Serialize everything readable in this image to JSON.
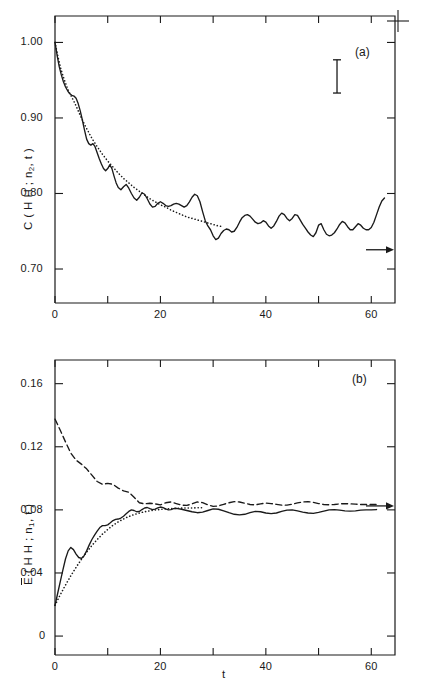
{
  "figure": {
    "width": 421,
    "height": 693,
    "background": "#ffffff",
    "ink": "#1a1a1a",
    "registration_mark": "+"
  },
  "chart_data": [
    {
      "type": "line",
      "panel_tag": "(a)",
      "title": "",
      "xlabel": "",
      "ylabel": "C (HH; n2,t)",
      "ylabel_parts": {
        "pre": "C ( H H ; n",
        "sub": "2",
        "post": ", t )"
      },
      "xlim": [
        0,
        64.5
      ],
      "ylim": [
        0.655,
        1.035
      ],
      "grid": false,
      "legend_position": "none",
      "xticks": [
        0,
        10,
        20,
        30,
        40,
        50,
        60
      ],
      "xticklabels": [
        "0",
        "",
        "20",
        "",
        "40",
        "",
        "60"
      ],
      "yticks": [
        1.0,
        0.9,
        0.8,
        0.7
      ],
      "yticklabels": [
        "1.00",
        "0.90",
        "0.80",
        "0.70"
      ],
      "error_bar": {
        "center": 0.955,
        "half_height": 0.022,
        "x": 53.5
      },
      "arrow_annotation": {
        "y": 0.7255,
        "label": "",
        "points": "right-to-axis"
      },
      "series": [
        {
          "name": "simulation",
          "style": "solid",
          "x": [
            0,
            0.4,
            0.8,
            1.2,
            1.6,
            2.0,
            2.4,
            2.8,
            3.2,
            3.6,
            4.0,
            4.4,
            4.8,
            5.2,
            5.6,
            6.0,
            6.4,
            6.8,
            7.2,
            7.6,
            8.0,
            8.4,
            8.8,
            9.2,
            9.6,
            10.0,
            10.4,
            10.8,
            11.2,
            11.6,
            12.0,
            12.5,
            13.0,
            13.5,
            14.0,
            14.5,
            15.0,
            15.5,
            16.0,
            16.5,
            17.0,
            17.5,
            18.0,
            18.5,
            19.0,
            19.5,
            20.0,
            20.5,
            21.0,
            21.5,
            22.0,
            22.5,
            23.0,
            23.5,
            24.0,
            24.5,
            25.0,
            25.5,
            26.0,
            26.5,
            27.0,
            27.5,
            28.0,
            28.5,
            29.0,
            29.5,
            30.0,
            30.5,
            31.0,
            31.5,
            32.0,
            32.5,
            33.0,
            33.5,
            34.0,
            34.5,
            35.0,
            35.5,
            36.0,
            36.5,
            37.0,
            37.5,
            38.0,
            38.5,
            39.0,
            39.5,
            40.0,
            40.5,
            41.0,
            41.5,
            42.0,
            42.5,
            43.0,
            43.5,
            44.0,
            44.5,
            45.0,
            45.5,
            46.0,
            46.5,
            47.0,
            47.5,
            48.0,
            48.5,
            49.0,
            49.5,
            50.0,
            50.5,
            51.0,
            51.5,
            52.0,
            52.5,
            53.0,
            53.5,
            54.0,
            54.5,
            55.0,
            55.5,
            56.0,
            56.5,
            57.0,
            57.5,
            58.0,
            58.5,
            59.0,
            59.5,
            60.0,
            60.5,
            61.0,
            61.5,
            62.0,
            62.5,
            63.0
          ],
          "y": [
            1.0,
            0.983,
            0.968,
            0.957,
            0.948,
            0.941,
            0.936,
            0.932,
            0.93,
            0.929,
            0.926,
            0.919,
            0.909,
            0.897,
            0.884,
            0.872,
            0.866,
            0.864,
            0.866,
            0.862,
            0.854,
            0.846,
            0.839,
            0.833,
            0.83,
            0.833,
            0.838,
            0.833,
            0.823,
            0.814,
            0.808,
            0.805,
            0.809,
            0.812,
            0.807,
            0.8,
            0.794,
            0.791,
            0.795,
            0.801,
            0.799,
            0.793,
            0.786,
            0.782,
            0.783,
            0.787,
            0.789,
            0.787,
            0.784,
            0.783,
            0.784,
            0.786,
            0.787,
            0.786,
            0.784,
            0.782,
            0.784,
            0.789,
            0.795,
            0.799,
            0.797,
            0.789,
            0.776,
            0.764,
            0.757,
            0.752,
            0.744,
            0.739,
            0.741,
            0.747,
            0.751,
            0.753,
            0.752,
            0.749,
            0.75,
            0.755,
            0.762,
            0.768,
            0.771,
            0.772,
            0.77,
            0.766,
            0.762,
            0.76,
            0.761,
            0.764,
            0.762,
            0.757,
            0.754,
            0.757,
            0.763,
            0.77,
            0.774,
            0.772,
            0.767,
            0.764,
            0.767,
            0.772,
            0.771,
            0.765,
            0.759,
            0.754,
            0.749,
            0.745,
            0.743,
            0.748,
            0.758,
            0.76,
            0.752,
            0.746,
            0.744,
            0.745,
            0.748,
            0.753,
            0.759,
            0.763,
            0.761,
            0.756,
            0.752,
            0.752,
            0.756,
            0.76,
            0.758,
            0.754,
            0.752,
            0.752,
            0.755,
            0.762,
            0.772,
            0.782,
            0.79,
            0.794
          ]
        },
        {
          "name": "theory",
          "style": "dotted",
          "x": [
            0,
            0.5,
            1.0,
            1.5,
            2.0,
            2.5,
            3.0,
            3.5,
            4.0,
            5.0,
            6.0,
            7.0,
            8.0,
            9.0,
            10.0,
            11.0,
            12.0,
            13.0,
            14.0,
            15.0,
            16.0,
            17.0,
            18.0,
            19.0,
            20.0,
            21.0,
            22.0,
            23.0,
            24.0,
            25.0,
            26.0,
            27.0,
            28.0,
            29.0,
            30.0,
            31.0,
            32.0
          ],
          "y": [
            1.0,
            0.983,
            0.968,
            0.956,
            0.946,
            0.937,
            0.93,
            0.923,
            0.916,
            0.9,
            0.886,
            0.873,
            0.862,
            0.852,
            0.843,
            0.835,
            0.827,
            0.82,
            0.814,
            0.808,
            0.803,
            0.798,
            0.793,
            0.789,
            0.785,
            0.782,
            0.778,
            0.775,
            0.772,
            0.769,
            0.767,
            0.765,
            0.763,
            0.761,
            0.759,
            0.757,
            0.756
          ]
        }
      ]
    },
    {
      "type": "line",
      "panel_tag": "(b)",
      "title": "",
      "xlabel": "t",
      "ylabel": "E (HH; n1,t)",
      "ylabel_parts": {
        "pre": "E",
        "mid": " ( H H ; n",
        "sub": "1",
        "post": ", t )"
      },
      "xlim": [
        0,
        64.5
      ],
      "ylim": [
        -0.012,
        0.175
      ],
      "grid": false,
      "legend_position": "none",
      "xticks": [
        0,
        10,
        20,
        30,
        40,
        50,
        60
      ],
      "xticklabels": [
        "0",
        "",
        "20",
        "",
        "40",
        "",
        "60"
      ],
      "yticks": [
        0.16,
        0.12,
        0.08,
        0.04,
        0
      ],
      "yticklabels": [
        "0.16",
        "0.12",
        "0.08",
        "0.04",
        "0"
      ],
      "arrow_annotation": {
        "y": 0.0825,
        "label": "",
        "points": "right-to-axis"
      },
      "series": [
        {
          "name": "upper-branch",
          "style": "dashed",
          "x": [
            0,
            1,
            2,
            3,
            4,
            5,
            6,
            7,
            8,
            9,
            10,
            11,
            12,
            13,
            14,
            15,
            16,
            17,
            18,
            19,
            20,
            21,
            22,
            23,
            24,
            25,
            26,
            27,
            28,
            29,
            30,
            31,
            32,
            33,
            34,
            35,
            36,
            37,
            38,
            39,
            40,
            41,
            42,
            43,
            44,
            45,
            46,
            47,
            48,
            49,
            50,
            51,
            52,
            53,
            54,
            55,
            56,
            57,
            58,
            59,
            60,
            61
          ],
          "y": [
            0.1375,
            0.1305,
            0.123,
            0.116,
            0.1115,
            0.109,
            0.106,
            0.102,
            0.098,
            0.0962,
            0.0968,
            0.0962,
            0.0938,
            0.092,
            0.0912,
            0.088,
            0.0845,
            0.0838,
            0.0842,
            0.0838,
            0.0832,
            0.0845,
            0.085,
            0.084,
            0.083,
            0.0828,
            0.0838,
            0.085,
            0.0846,
            0.0832,
            0.0822,
            0.0825,
            0.0835,
            0.0845,
            0.0852,
            0.085,
            0.0842,
            0.0834,
            0.0832,
            0.0838,
            0.0843,
            0.084,
            0.0835,
            0.083,
            0.083,
            0.0836,
            0.0844,
            0.085,
            0.0852,
            0.0848,
            0.084,
            0.0834,
            0.0832,
            0.0834,
            0.0838,
            0.084,
            0.0838,
            0.0836,
            0.0834,
            0.0834,
            0.0834,
            0.0834
          ]
        },
        {
          "name": "lower-branch",
          "style": "solid",
          "x": [
            0,
            0.5,
            1.0,
            1.5,
            2.0,
            2.5,
            3.0,
            3.5,
            4.0,
            4.5,
            5.0,
            5.5,
            6.0,
            6.5,
            7.0,
            7.5,
            8.0,
            8.5,
            9.0,
            9.5,
            10.0,
            10.5,
            11.0,
            11.5,
            12.0,
            12.5,
            13.0,
            13.5,
            14.0,
            14.5,
            15.0,
            15.5,
            16.0,
            16.5,
            17.0,
            17.5,
            18.0,
            18.5,
            19.0,
            19.5,
            20.0,
            20.5,
            21.0,
            21.5,
            22.0,
            22.5,
            23.0,
            24.0,
            25.0,
            26.0,
            27.0,
            28.0,
            29.0,
            30.0,
            31.0,
            32.0,
            33.0,
            34.0,
            35.0,
            36.0,
            37.0,
            38.0,
            39.0,
            40.0,
            41.0,
            42.0,
            43.0,
            44.0,
            45.0,
            46.0,
            47.0,
            48.0,
            49.0,
            50.0,
            51.0,
            52.0,
            53.0,
            54.0,
            55.0,
            56.0,
            57.0,
            58.0,
            59.0,
            60.0,
            61.0
          ],
          "y": [
            0.0195,
            0.027,
            0.0345,
            0.042,
            0.049,
            0.054,
            0.0562,
            0.0548,
            0.052,
            0.0498,
            0.0492,
            0.0508,
            0.054,
            0.0578,
            0.0612,
            0.064,
            0.0665,
            0.0688,
            0.07,
            0.07,
            0.0705,
            0.0718,
            0.0732,
            0.074,
            0.0742,
            0.0748,
            0.076,
            0.0775,
            0.079,
            0.08,
            0.0796,
            0.0788,
            0.079,
            0.0802,
            0.0812,
            0.0815,
            0.0808,
            0.0802,
            0.0805,
            0.0812,
            0.0818,
            0.0814,
            0.0806,
            0.08,
            0.0802,
            0.0808,
            0.081,
            0.0804,
            0.0796,
            0.0788,
            0.0782,
            0.0786,
            0.0796,
            0.0806,
            0.0804,
            0.0794,
            0.0782,
            0.0772,
            0.0768,
            0.0772,
            0.0782,
            0.079,
            0.0788,
            0.078,
            0.0776,
            0.078,
            0.079,
            0.0798,
            0.08,
            0.0794,
            0.0786,
            0.078,
            0.0778,
            0.0784,
            0.0792,
            0.08,
            0.0802,
            0.0798,
            0.0794,
            0.0792,
            0.0794,
            0.0798,
            0.08,
            0.08,
            0.0802
          ]
        },
        {
          "name": "theory",
          "style": "dotted",
          "x": [
            0,
            1,
            2,
            3,
            4,
            5,
            6,
            7,
            8,
            9,
            10,
            11,
            12,
            13,
            14,
            15,
            16,
            17,
            18,
            19,
            20,
            21,
            22,
            23,
            24,
            25,
            26,
            27,
            28
          ],
          "y": [
            0.0195,
            0.0262,
            0.0324,
            0.0382,
            0.0436,
            0.0486,
            0.0532,
            0.0574,
            0.0612,
            0.0646,
            0.0676,
            0.0702,
            0.0724,
            0.0742,
            0.0758,
            0.077,
            0.078,
            0.0788,
            0.0794,
            0.0799,
            0.0803,
            0.0806,
            0.0808,
            0.081,
            0.0811,
            0.0812,
            0.0812,
            0.0813,
            0.0813
          ]
        }
      ]
    }
  ]
}
